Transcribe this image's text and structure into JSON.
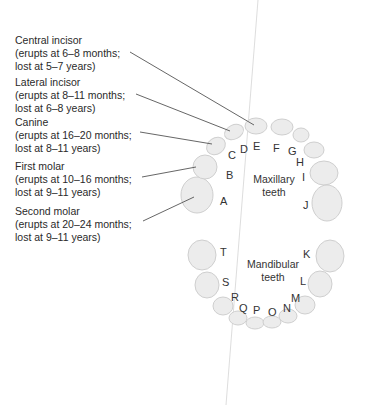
{
  "diagram": {
    "type": "dental-chart",
    "callouts": [
      {
        "name": "Central incisor",
        "line1": "Central incisor",
        "line2": "(erupts at 6–8 months;",
        "line3": "lost at 5–7 years)"
      },
      {
        "name": "Lateral incisor",
        "line1": "Lateral incisor",
        "line2": "(erupts at 8–11 months;",
        "line3": "lost at 6–8 years)"
      },
      {
        "name": "Canine",
        "line1": "Canine",
        "line2": "(erupts at 16–20 months;",
        "line3": "lost at 8–11 years)"
      },
      {
        "name": "First molar",
        "line1": "First molar",
        "line2": "(erupts at 10–16 months;",
        "line3": "lost at 9–11 years)"
      },
      {
        "name": "Second molar",
        "line1": "Second molar",
        "line2": "(erupts at 20–24 months;",
        "line3": "lost at 9–11 years)"
      }
    ],
    "maxillary": {
      "line1": "Maxillary",
      "line2": "teeth",
      "letters": [
        "A",
        "B",
        "C",
        "D",
        "E",
        "F",
        "G",
        "H",
        "I",
        "J"
      ]
    },
    "mandibular": {
      "line1": "Mandibular",
      "line2": "teeth",
      "letters": [
        "K",
        "L",
        "M",
        "N",
        "O",
        "P",
        "Q",
        "R",
        "S",
        "T"
      ]
    },
    "colors": {
      "tooth_fill": "#ececec",
      "tooth_stroke": "#cfcfcf",
      "leader": "#555555",
      "text": "#2a2a2a"
    }
  }
}
